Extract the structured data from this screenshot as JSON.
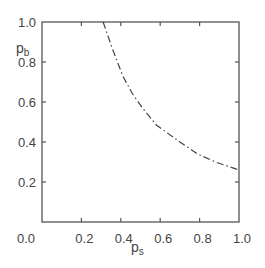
{
  "chart_data": {
    "type": "line",
    "title": "",
    "xlabel": "p",
    "xlabel_sub": "s",
    "ylabel": "p",
    "ylabel_sub": "b",
    "xlim": [
      0.0,
      1.0
    ],
    "ylim": [
      0.0,
      1.0
    ],
    "grid": false,
    "legend": null,
    "x_ticks": [
      "0.2",
      "0.4",
      "0.6",
      "0.8",
      "1.0"
    ],
    "y_ticks": [
      "0.2",
      "0.4",
      "0.6",
      "0.8",
      "1.0"
    ],
    "origin_label": "0.0",
    "series": [
      {
        "name": "boundary",
        "style": "dash-dot",
        "x": [
          0.31,
          0.36,
          0.41,
          0.46,
          0.51,
          0.58,
          0.7,
          0.79,
          0.88,
          1.0
        ],
        "y": [
          1.0,
          0.86,
          0.73,
          0.64,
          0.57,
          0.485,
          0.4,
          0.34,
          0.3,
          0.26
        ]
      }
    ]
  }
}
